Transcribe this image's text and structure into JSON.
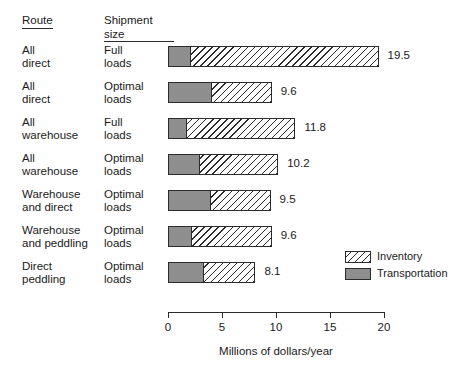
{
  "headers": {
    "route": "Route",
    "shipment_size": "Shipment\nsize"
  },
  "legend": {
    "position": "bottom-right",
    "items": [
      {
        "label": "Inventory",
        "pattern": "diagonal-hatch",
        "color": "#ffffff"
      },
      {
        "label": "Transportation",
        "pattern": "solid",
        "color": "#8e8e8e"
      }
    ]
  },
  "axis": {
    "title": "Millions of dollars/year",
    "ticks": [
      "0",
      "5",
      "10",
      "15",
      "20"
    ],
    "min": 0,
    "max": 20
  },
  "chart_data": {
    "type": "bar",
    "orientation": "horizontal",
    "stacked": true,
    "title": "",
    "xlabel": "Millions of dollars/year",
    "ylabel": "",
    "xlim": [
      0,
      20
    ],
    "xticks": [
      0,
      5,
      10,
      15,
      20
    ],
    "grid": false,
    "legend_position": "bottom-right",
    "categories": [
      "All direct / Full loads",
      "All direct / Optimal loads",
      "All warehouse / Full loads",
      "All warehouse / Optimal loads",
      "Warehouse and direct / Optimal loads",
      "Warehouse and peddling / Optimal loads",
      "Direct peddling / Optimal loads"
    ],
    "series": [
      {
        "name": "Transportation",
        "values": [
          2.0,
          4.0,
          1.7,
          2.9,
          3.9,
          2.1,
          3.2
        ]
      },
      {
        "name": "Inventory",
        "values": [
          17.5,
          5.6,
          10.1,
          7.3,
          5.6,
          7.5,
          4.9
        ]
      }
    ],
    "totals": [
      19.5,
      9.6,
      11.8,
      10.2,
      9.5,
      9.6,
      8.1
    ],
    "rows": [
      {
        "route": "All\ndirect",
        "shipment_size": "Full\nloads",
        "transportation": 2.0,
        "inventory": 17.5,
        "total": "19.5"
      },
      {
        "route": "All\ndirect",
        "shipment_size": "Optimal\nloads",
        "transportation": 4.0,
        "inventory": 5.6,
        "total": "9.6"
      },
      {
        "route": "All\nwarehouse",
        "shipment_size": "Full\nloads",
        "transportation": 1.7,
        "inventory": 10.1,
        "total": "11.8"
      },
      {
        "route": "All\nwarehouse",
        "shipment_size": "Optimal\nloads",
        "transportation": 2.9,
        "inventory": 7.3,
        "total": "10.2"
      },
      {
        "route": "Warehouse\nand direct",
        "shipment_size": "Optimal\nloads",
        "transportation": 3.9,
        "inventory": 5.6,
        "total": "9.5"
      },
      {
        "route": "Warehouse\nand peddling",
        "shipment_size": "Optimal\nloads",
        "transportation": 2.1,
        "inventory": 7.5,
        "total": "9.6"
      },
      {
        "route": "Direct\npeddling",
        "shipment_size": "Optimal\nloads",
        "transportation": 3.2,
        "inventory": 4.9,
        "total": "8.1"
      }
    ]
  }
}
